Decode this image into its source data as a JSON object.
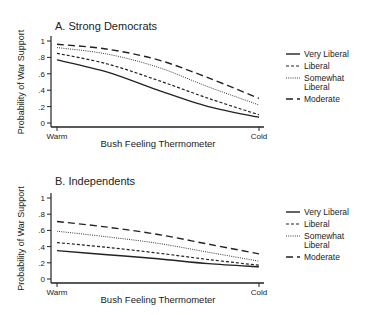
{
  "chart_data": [
    {
      "type": "line",
      "title": "A. Strong Democrats",
      "xlabel": "Bush Feeling Thermometer",
      "ylabel": "Probability of War Support",
      "x_tick_labels": [
        "Warm",
        "Cold"
      ],
      "y_ticks": [
        "0",
        ".2",
        ".4",
        ".6",
        ".8",
        "1"
      ],
      "ylim": [
        0,
        1
      ],
      "x": [
        0,
        0.25,
        0.5,
        0.75,
        1
      ],
      "grid": false,
      "legend_position": "right",
      "series": [
        {
          "name": "Very Liberal",
          "style": "solid",
          "values": [
            0.77,
            0.62,
            0.4,
            0.2,
            0.07
          ]
        },
        {
          "name": "Liberal",
          "style": "dashed",
          "values": [
            0.85,
            0.72,
            0.52,
            0.3,
            0.1
          ]
        },
        {
          "name": "Somewhat Liberal",
          "style": "dotted",
          "values": [
            0.92,
            0.84,
            0.68,
            0.44,
            0.22
          ]
        },
        {
          "name": "Moderate",
          "style": "longdash",
          "values": [
            0.96,
            0.9,
            0.77,
            0.55,
            0.3
          ]
        }
      ]
    },
    {
      "type": "line",
      "title": "B. Independents",
      "xlabel": "Bush Feeling Thermometer",
      "ylabel": "Probability of War Support",
      "x_tick_labels": [
        "Warm",
        "Cold"
      ],
      "y_ticks": [
        "0",
        ".2",
        ".4",
        ".6",
        ".8",
        "1"
      ],
      "ylim": [
        0,
        1
      ],
      "x": [
        0,
        0.25,
        0.5,
        0.75,
        1
      ],
      "grid": false,
      "legend_position": "right",
      "series": [
        {
          "name": "Very Liberal",
          "style": "solid",
          "values": [
            0.35,
            0.3,
            0.25,
            0.19,
            0.15
          ]
        },
        {
          "name": "Liberal",
          "style": "dashed",
          "values": [
            0.45,
            0.39,
            0.32,
            0.24,
            0.17
          ]
        },
        {
          "name": "Somewhat Liberal",
          "style": "dotted",
          "values": [
            0.59,
            0.52,
            0.44,
            0.33,
            0.22
          ]
        },
        {
          "name": "Moderate",
          "style": "longdash",
          "values": [
            0.71,
            0.64,
            0.55,
            0.43,
            0.31
          ]
        }
      ]
    }
  ],
  "legend": {
    "items": [
      {
        "label_lines": [
          "Very Liberal"
        ],
        "style": "solid"
      },
      {
        "label_lines": [
          "Liberal"
        ],
        "style": "dashed"
      },
      {
        "label_lines": [
          "Somewhat",
          "Liberal"
        ],
        "style": "dotted"
      },
      {
        "label_lines": [
          "Moderate"
        ],
        "style": "longdash"
      }
    ]
  },
  "colors": {
    "line": "#222222",
    "background": "#ffffff"
  }
}
